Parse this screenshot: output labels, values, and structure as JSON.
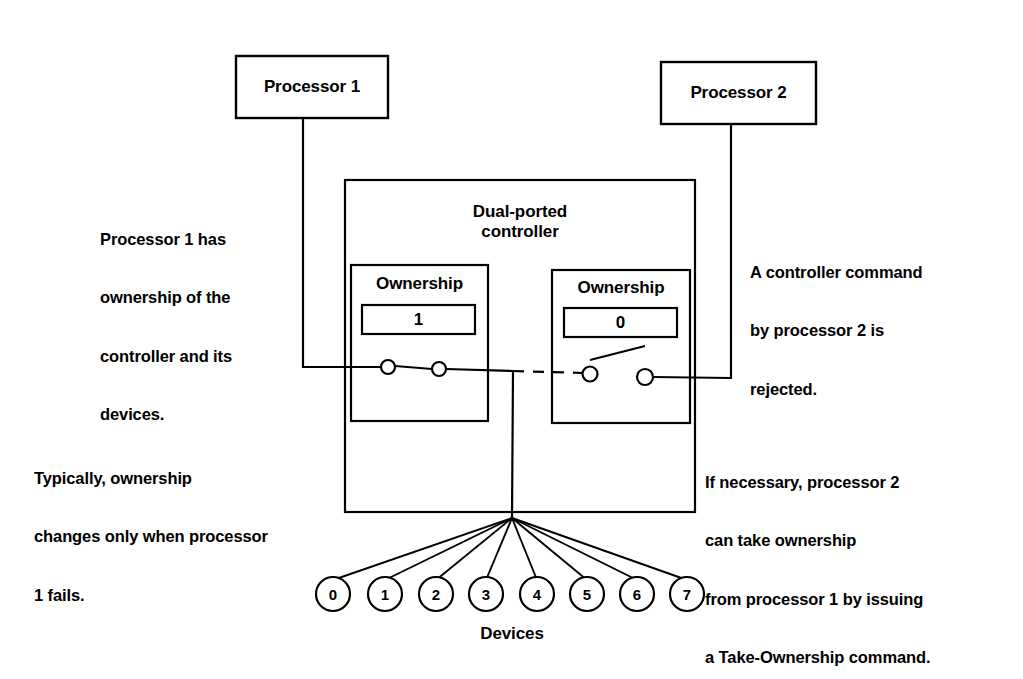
{
  "diagram": {
    "title_nodes": {
      "processor1": "Processor 1",
      "processor2": "Processor 2",
      "controller": "Dual-ported\ncontroller",
      "controller_line1": "Dual-ported",
      "controller_line2": "controller"
    },
    "ports": [
      {
        "id": "port-left",
        "title": "Ownership",
        "value": "1",
        "switch_state": "closed"
      },
      {
        "id": "port-right",
        "title": "Ownership",
        "value": "0",
        "switch_state": "open"
      }
    ],
    "annotations": [
      {
        "id": "note-proc1-ownership",
        "text": "Processor 1 has\nownership of the\ncontroller and its\ndevices.",
        "lines": [
          "Processor 1 has",
          "ownership of the",
          "controller and its",
          "devices."
        ]
      },
      {
        "id": "note-proc2-rejected",
        "text": "A controller command\nby processor 2 is\nrejected.",
        "lines": [
          "A controller command",
          "by processor 2 is",
          "rejected."
        ]
      },
      {
        "id": "note-ownership-change",
        "text": "Typically, ownership\nchanges only when processor\n1 fails.",
        "lines": [
          "Typically, ownership",
          "changes only when processor",
          "1 fails."
        ]
      },
      {
        "id": "note-take-ownership",
        "text": "If necessary, processor 2\ncan take ownership\nfrom processor 1 by issuing\na Take-Ownership command.",
        "lines": [
          "If necessary, processor 2",
          "can take ownership",
          "from processor 1 by issuing",
          "a Take-Ownership command."
        ]
      }
    ],
    "devices": {
      "label": "Devices",
      "items": [
        "0",
        "1",
        "2",
        "3",
        "4",
        "5",
        "6",
        "7"
      ]
    },
    "colors": {
      "stroke": "#000000",
      "background": "#ffffff",
      "text": "#000000"
    }
  }
}
